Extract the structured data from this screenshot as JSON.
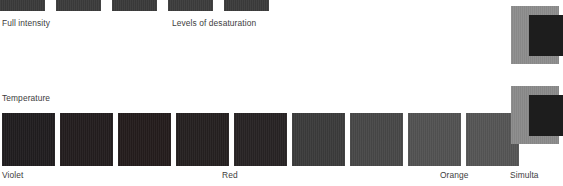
{
  "canvas": {
    "width": 541,
    "height": 186,
    "background": "#ffffff"
  },
  "sections": {
    "intensity": {
      "caption_left": "Full intensity",
      "caption_right": "Levels of desaturation",
      "caption_left_x": 2,
      "caption_right_x": 172,
      "caption_y": 18,
      "row_y": -8,
      "swatch_height": 19,
      "swatches": [
        {
          "x": 0,
          "width": 45,
          "color": "#3a3a3a"
        },
        {
          "x": 56,
          "width": 45,
          "color": "#3b3b3b"
        },
        {
          "x": 112,
          "width": 45,
          "color": "#3a3a3a"
        },
        {
          "x": 168,
          "width": 45,
          "color": "#3c3c3c"
        },
        {
          "x": 224,
          "width": 45,
          "color": "#3b3b3b"
        }
      ]
    },
    "temperature": {
      "caption": "Temperature",
      "caption_x": 2,
      "caption_y": 93,
      "row_y": 113,
      "swatch_size": 53,
      "swatch_gap": 5,
      "swatches": [
        {
          "x": 2,
          "color": "#201d1f",
          "name": "violet"
        },
        {
          "x": 60,
          "color": "#231d1e",
          "name": "violet-red-1"
        },
        {
          "x": 118,
          "color": "#241c1c",
          "name": "violet-red-2"
        },
        {
          "x": 176,
          "color": "#252020",
          "name": "red-dark"
        },
        {
          "x": 234,
          "color": "#272324",
          "name": "red"
        },
        {
          "x": 292,
          "color": "#3b3b3b",
          "name": "red-orange-1"
        },
        {
          "x": 350,
          "color": "#474747",
          "name": "red-orange-2"
        },
        {
          "x": 408,
          "color": "#525252",
          "name": "orange-1"
        },
        {
          "x": 466,
          "color": "#555555",
          "name": "orange"
        }
      ],
      "labels": [
        {
          "text": "Violet",
          "x": 2
        },
        {
          "text": "Red",
          "x": 222
        },
        {
          "text": "Orange",
          "x": 440
        }
      ],
      "labels_y": 170
    },
    "simultaneous_contrast": {
      "caption": "Simulta",
      "caption_x": 510,
      "caption_y": 170,
      "panels": [
        {
          "x": 511,
          "y": 6,
          "width": 48,
          "height": 58,
          "outer_color": "#8c8c8c",
          "inner_x": 529,
          "inner_y": 15,
          "inner_width": 34,
          "inner_height": 41,
          "inner_color": "#1d1d1d"
        },
        {
          "x": 511,
          "y": 86,
          "width": 48,
          "height": 58,
          "outer_color": "#8a8a8a",
          "inner_x": 529,
          "inner_y": 95,
          "inner_width": 34,
          "inner_height": 41,
          "inner_color": "#1d1d1d"
        }
      ]
    }
  }
}
